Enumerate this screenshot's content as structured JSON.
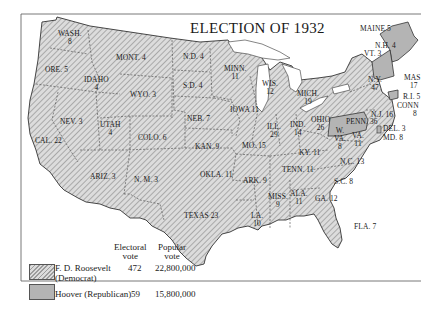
{
  "title": "ELECTION OF 1932",
  "colors": {
    "democrat_fill": "#d8d8d8",
    "democrat_hatch": "#9a9a9a",
    "republican_fill": "#b4b4b4",
    "border": "#333333",
    "background": "#ffffff"
  },
  "states": [
    {
      "name": "WASH.",
      "votes": "8",
      "party": "D"
    },
    {
      "name": "ORE.",
      "votes": "5",
      "party": "D"
    },
    {
      "name": "CAL.",
      "votes": "22",
      "party": "D"
    },
    {
      "name": "IDAHO",
      "votes": "4",
      "party": "D"
    },
    {
      "name": "NEV.",
      "votes": "3",
      "party": "D"
    },
    {
      "name": "MONT.",
      "votes": "4",
      "party": "D"
    },
    {
      "name": "WYO.",
      "votes": "3",
      "party": "D"
    },
    {
      "name": "UTAH",
      "votes": "4",
      "party": "D"
    },
    {
      "name": "COLO.",
      "votes": "6",
      "party": "D"
    },
    {
      "name": "ARIZ.",
      "votes": "3",
      "party": "D"
    },
    {
      "name": "N. M.",
      "votes": "3",
      "party": "D"
    },
    {
      "name": "N.D.",
      "votes": "4",
      "party": "D"
    },
    {
      "name": "S.D.",
      "votes": "4",
      "party": "D"
    },
    {
      "name": "NEB.",
      "votes": "7",
      "party": "D"
    },
    {
      "name": "KAN.",
      "votes": "9",
      "party": "D"
    },
    {
      "name": "OKLA.",
      "votes": "11",
      "party": "D"
    },
    {
      "name": "TEXAS",
      "votes": "23",
      "party": "D"
    },
    {
      "name": "MINN.",
      "votes": "11",
      "party": "D"
    },
    {
      "name": "IOWA",
      "votes": "11",
      "party": "D"
    },
    {
      "name": "MO.",
      "votes": "15",
      "party": "D"
    },
    {
      "name": "ARK.",
      "votes": "9",
      "party": "D"
    },
    {
      "name": "LA.",
      "votes": "10",
      "party": "D"
    },
    {
      "name": "WIS.",
      "votes": "12",
      "party": "D"
    },
    {
      "name": "ILL.",
      "votes": "29",
      "party": "D"
    },
    {
      "name": "MICH.",
      "votes": "19",
      "party": "D"
    },
    {
      "name": "IND.",
      "votes": "14",
      "party": "D"
    },
    {
      "name": "OHIO",
      "votes": "26",
      "party": "D"
    },
    {
      "name": "KY.",
      "votes": "11",
      "party": "D"
    },
    {
      "name": "TENN.",
      "votes": "11",
      "party": "D"
    },
    {
      "name": "MISS.",
      "votes": "9",
      "party": "D"
    },
    {
      "name": "ALA.",
      "votes": "11",
      "party": "D"
    },
    {
      "name": "GA.",
      "votes": "12",
      "party": "D"
    },
    {
      "name": "FLA.",
      "votes": "7",
      "party": "D"
    },
    {
      "name": "S.C.",
      "votes": "8",
      "party": "D"
    },
    {
      "name": "N.C.",
      "votes": "13",
      "party": "D"
    },
    {
      "name": "VA.",
      "votes": "11",
      "party": "D"
    },
    {
      "name": "W. VA.",
      "votes": "8",
      "party": "D"
    },
    {
      "name": "MD.",
      "votes": "8",
      "party": "D"
    },
    {
      "name": "N.Y.",
      "votes": "47",
      "party": "D"
    },
    {
      "name": "MASS.",
      "votes": "17",
      "party": "D"
    },
    {
      "name": "R.I.",
      "votes": "5",
      "party": "D"
    },
    {
      "name": "PENN.",
      "votes": "36",
      "party": "R"
    },
    {
      "name": "MAINE",
      "votes": "5",
      "party": "R"
    },
    {
      "name": "N.H.",
      "votes": "4",
      "party": "R"
    },
    {
      "name": "VT.",
      "votes": "3",
      "party": "R"
    },
    {
      "name": "CONN.",
      "votes": "8",
      "party": "R"
    },
    {
      "name": "N.J.",
      "votes": "16",
      "party": "D"
    },
    {
      "name": "DEL.",
      "votes": "3",
      "party": "R"
    }
  ],
  "labels": {
    "wash": "WASH.",
    "wash_v": "8",
    "ore": "ORE. 5",
    "cal": "CAL. 22",
    "idaho": "IDAHO",
    "idaho_v": "4",
    "nev": "NEV. 3",
    "mont": "MONT. 4",
    "wyo": "WYO. 3",
    "utah": "UTAH",
    "utah_v": "4",
    "colo": "COLO. 6",
    "ariz": "ARIZ. 3",
    "nm": "N. M. 3",
    "nd": "N.D. 4",
    "sd": "S.D. 4",
    "neb": "NEB. 7",
    "kan": "KAN. 9",
    "okla": "OKLA. 11",
    "texas": "TEXAS 23",
    "minn": "MINN.",
    "minn_v": "11",
    "iowa": "IOWA 11",
    "mo": "MO. 15",
    "ark": "ARK. 9",
    "la": "LA.",
    "la_v": "10",
    "wis": "WIS.",
    "wis_v": "12",
    "ill": "ILL.",
    "ill_v": "29",
    "mich": "MICH.",
    "mich_v": "19",
    "ind": "IND.",
    "ind_v": "14",
    "ohio": "OHIO",
    "ohio_v": "26",
    "ky": "KY. 11",
    "tenn": "TENN. 11",
    "miss": "MISS.",
    "miss_v": "9",
    "ala": "ALA.",
    "ala_v": "11",
    "ga": "GA. 12",
    "fla": "FLA. 7",
    "sc": "S.C. 8",
    "nc": "N.C. 13",
    "va": "VA.",
    "va_v": "11",
    "wva": "W.",
    "wva2": "VA.",
    "wva_v": "8",
    "md": "MD. 8",
    "del": "DEL. 3",
    "nj": "N.J. 16",
    "conn": "CONN",
    "conn_v": "8",
    "ri": "R.I. 5",
    "mass": "MAS",
    "mass_v": "17",
    "ny": "N.Y.",
    "ny_v": "47",
    "penn": "PENN. 36",
    "maine": "MAINE 5",
    "nh": "N.H. 4",
    "vt": "VT. 3"
  },
  "legend": {
    "col_electoral": "Electoral",
    "col_electoral2": "vote",
    "col_popular": "Popular",
    "col_popular2": "vote",
    "rows": [
      {
        "candidate": "F. D. Roosevelt",
        "party": "(Democrat)",
        "electoral": "472",
        "popular": "22,800,000"
      },
      {
        "candidate": "Hoover (Republican)",
        "party": "",
        "electoral": "59",
        "popular": "15,800,000"
      }
    ]
  }
}
